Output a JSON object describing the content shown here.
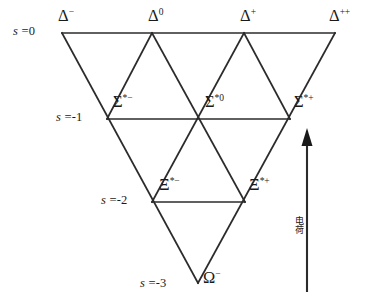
{
  "figure": {
    "type": "baryon-decuplet-weight-diagram",
    "line_color": "#2b2b2b",
    "text_color": "#1a1a1a",
    "background": "#ffffff"
  },
  "rows": [
    {
      "key": "s0",
      "label_s": "s",
      "label_eq": " =0",
      "y": 33
    },
    {
      "key": "s-1",
      "label_s": "s",
      "label_eq": " =-1",
      "y": 119
    },
    {
      "key": "s-2",
      "label_s": "s",
      "label_eq": " =-2",
      "y": 202
    },
    {
      "key": "s-3",
      "label_s": "s",
      "label_eq": " =-3",
      "y": 283
    }
  ],
  "particles": [
    {
      "id": "delta-minus",
      "symbol": "Δ",
      "charge": "−",
      "strangeness": 0,
      "x": 62,
      "y": 33
    },
    {
      "id": "delta-zero",
      "symbol": "Δ",
      "charge": "0",
      "strangeness": 0,
      "x": 152,
      "y": 33
    },
    {
      "id": "delta-plus",
      "symbol": "Δ",
      "charge": "+",
      "strangeness": 0,
      "x": 244,
      "y": 33
    },
    {
      "id": "delta-plusplus",
      "symbol": "Δ",
      "charge": "++",
      "strangeness": 0,
      "x": 335,
      "y": 33
    },
    {
      "id": "sigma-star-minus",
      "symbol": "Σ",
      "charge": "*−",
      "strangeness": -1,
      "x": 107,
      "y": 119
    },
    {
      "id": "sigma-star-zero",
      "symbol": "Σ",
      "charge": "*0",
      "strangeness": -1,
      "x": 198,
      "y": 119
    },
    {
      "id": "sigma-star-plus",
      "symbol": "Σ",
      "charge": "*+",
      "strangeness": -1,
      "x": 290,
      "y": 119
    },
    {
      "id": "xi-star-minus",
      "symbol": "Ξ",
      "charge": "*−",
      "strangeness": -2,
      "x": 152,
      "y": 202
    },
    {
      "id": "xi-star-plus",
      "symbol": "Ξ",
      "charge": "*+",
      "strangeness": -2,
      "x": 245,
      "y": 202
    },
    {
      "id": "omega-minus",
      "symbol": "Ω",
      "charge": "−",
      "strangeness": -3,
      "x": 198,
      "y": 283
    }
  ],
  "labels": {
    "delta_minus": "Δ",
    "delta_minus_sup": "−",
    "delta_zero": "Δ",
    "delta_zero_sup": "0",
    "delta_plus": "Δ",
    "delta_plus_sup": "+",
    "delta_plusplus": "Δ",
    "delta_plusplus_sup": "++",
    "sigma_minus": "Σ",
    "sigma_minus_sup": "*−",
    "sigma_zero": "Σ",
    "sigma_zero_sup": "*0",
    "sigma_plus": "Σ",
    "sigma_plus_sup": "*+",
    "xi_minus": "Ξ",
    "xi_minus_sup": "*−",
    "xi_plus": "Ξ",
    "xi_plus_sup": "*+",
    "omega": "Ω",
    "omega_sup": "−",
    "s0_var": "s",
    "s0_val": " =0",
    "s1_var": "s",
    "s1_val": " =-1",
    "s2_var": "s",
    "s2_val": " =-2",
    "s3_var": "s",
    "s3_val": " =-3"
  },
  "axis": {
    "caption": "电荷",
    "direction": "up",
    "arrow_x": 307,
    "arrow_top_y": 130,
    "arrow_bottom_y": 292
  }
}
